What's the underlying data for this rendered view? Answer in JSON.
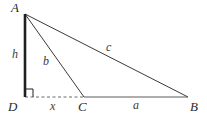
{
  "figure": {
    "width": 207,
    "height": 120,
    "background_color": "#ffffff",
    "stroke_color": "#3a3a3a",
    "thick_stroke_color": "#1f1f1f"
  },
  "vertices": [
    {
      "id": "A",
      "label": "A",
      "x": 25,
      "y": 14,
      "label_x": 11,
      "label_y": 1
    },
    {
      "id": "D",
      "label": "D",
      "x": 25,
      "y": 97,
      "label_x": 8,
      "label_y": 100
    },
    {
      "id": "C",
      "label": "C",
      "x": 84,
      "y": 97,
      "label_x": 78,
      "label_y": 100
    },
    {
      "id": "B",
      "label": "B",
      "x": 188,
      "y": 97,
      "label_x": 190,
      "label_y": 100
    }
  ],
  "segments": [
    {
      "id": "AD",
      "from": "A",
      "to": "D",
      "style": "solid",
      "width": 2.6,
      "measure_label": "h"
    },
    {
      "id": "AC",
      "from": "A",
      "to": "C",
      "style": "solid",
      "width": 1.0,
      "measure_label": "b"
    },
    {
      "id": "AB",
      "from": "A",
      "to": "B",
      "style": "solid",
      "width": 1.0,
      "measure_label": "c"
    },
    {
      "id": "CB",
      "from": "C",
      "to": "B",
      "style": "solid",
      "width": 1.0,
      "measure_label": "a"
    },
    {
      "id": "DC",
      "from": "D",
      "to": "C",
      "style": "dashed",
      "width": 1.0,
      "measure_label": "x"
    }
  ],
  "measure_labels": [
    {
      "id": "h",
      "text": "h",
      "x": 12,
      "y": 48,
      "for_segment": "AD"
    },
    {
      "id": "b",
      "text": "b",
      "x": 43,
      "y": 55,
      "for_segment": "AC"
    },
    {
      "id": "c",
      "text": "c",
      "x": 106,
      "y": 41,
      "for_segment": "AB"
    },
    {
      "id": "a",
      "text": "a",
      "x": 133,
      "y": 99,
      "for_segment": "CB"
    },
    {
      "id": "x",
      "text": "x",
      "x": 50,
      "y": 100,
      "for_segment": "DC"
    }
  ],
  "right_angle": {
    "at_vertex": "D",
    "size": 8,
    "description": "right-angle-marker"
  }
}
